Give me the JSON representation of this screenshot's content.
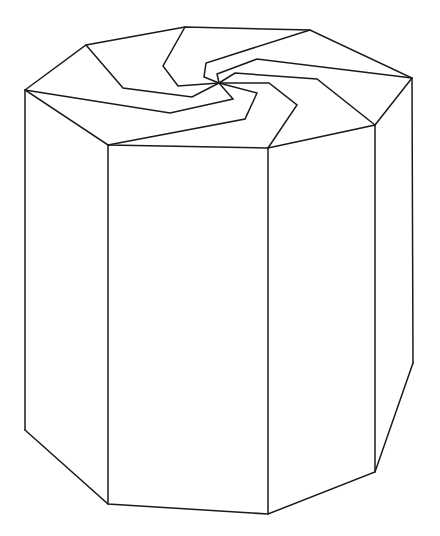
{
  "figure": {
    "stroke_color": "#1a1a1a",
    "background": "#ffffff"
  },
  "geometry": {
    "top_outline": [
      [
        25,
        90
      ],
      [
        86,
        45
      ],
      [
        185,
        27
      ],
      [
        310,
        30
      ],
      [
        412,
        78
      ],
      [
        375,
        125
      ],
      [
        268,
        148
      ],
      [
        108,
        145
      ]
    ],
    "top_center": [
      219,
      83
    ],
    "swirl_arms": [
      [
        [
          185,
          27
        ],
        [
          163,
          66
        ],
        [
          178,
          86
        ],
        [
          219,
          83
        ]
      ],
      [
        [
          310,
          30
        ],
        [
          206,
          63
        ],
        [
          204,
          77
        ],
        [
          219,
          83
        ]
      ],
      [
        [
          412,
          78
        ],
        [
          257,
          59
        ],
        [
          217,
          74
        ],
        [
          219,
          83
        ]
      ],
      [
        [
          375,
          125
        ],
        [
          317,
          79
        ],
        [
          235,
          73
        ],
        [
          219,
          83
        ]
      ],
      [
        [
          268,
          148
        ],
        [
          297,
          105
        ],
        [
          269,
          83
        ],
        [
          219,
          83
        ]
      ],
      [
        [
          108,
          145
        ],
        [
          245,
          119
        ],
        [
          257,
          93
        ],
        [
          219,
          83
        ]
      ],
      [
        [
          25,
          90
        ],
        [
          170,
          113
        ],
        [
          233,
          99
        ],
        [
          219,
          83
        ]
      ],
      [
        [
          86,
          45
        ],
        [
          123,
          88
        ],
        [
          192,
          97
        ],
        [
          219,
          83
        ]
      ]
    ],
    "vertical_edges": [
      [
        [
          25,
          90
        ],
        [
          25,
          430
        ]
      ],
      [
        [
          108,
          145
        ],
        [
          108,
          504
        ]
      ],
      [
        [
          268,
          148
        ],
        [
          268,
          514
        ]
      ],
      [
        [
          375,
          125
        ],
        [
          375,
          472
        ]
      ],
      [
        [
          412,
          78
        ],
        [
          413,
          363
        ]
      ]
    ],
    "bottom_outline": [
      [
        25,
        430
      ],
      [
        108,
        504
      ],
      [
        268,
        514
      ],
      [
        375,
        472
      ],
      [
        413,
        363
      ]
    ]
  }
}
